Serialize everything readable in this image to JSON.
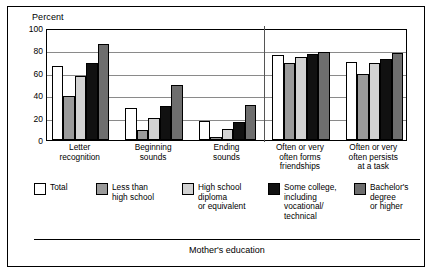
{
  "figure": {
    "y_axis_title": "Percent",
    "x_axis_title": "Mother's education"
  },
  "chart_data": {
    "type": "bar",
    "title": "",
    "subtitle": "",
    "xlabel": "Mother's education",
    "ylabel": "Percent",
    "ylim": [
      0,
      100
    ],
    "yticks": [
      0,
      20,
      40,
      60,
      80,
      100
    ],
    "ytick_labels": [
      "0",
      "20",
      "40",
      "60",
      "80",
      "100"
    ],
    "grid": true,
    "legend_position": "below-plot",
    "group_divider_after_category": 3,
    "categories": [
      "Letter\nrecognition",
      "Beginning\nsounds",
      "Ending\nsounds",
      "Often or very\noften forms\nfriendships",
      "Often or very\noften persists\nat a task"
    ],
    "series": [
      {
        "name": "Total",
        "color": "#ffffff",
        "values": [
          66,
          29,
          17,
          76,
          70
        ]
      },
      {
        "name": "Less than high school",
        "color": "#9a9a9a",
        "values": [
          39,
          9,
          3,
          69,
          59
        ]
      },
      {
        "name": "High school diploma or equivalent",
        "color": "#d2d2d2",
        "values": [
          57,
          20,
          10,
          74,
          69
        ]
      },
      {
        "name": "Some college, including vocational/technical",
        "color": "#111111",
        "values": [
          69,
          30,
          16,
          77,
          72
        ]
      },
      {
        "name": "Bachelor's degree or higher",
        "color": "#6e6e6e",
        "values": [
          86,
          49,
          31,
          79,
          78
        ]
      }
    ]
  },
  "legend": {
    "items": [
      {
        "label": "Total",
        "swatch": "sw-total"
      },
      {
        "label": "Less than\nhigh school",
        "swatch": "sw-lths"
      },
      {
        "label": "High school\ndiploma\nor equivalent",
        "swatch": "sw-hsdiploma"
      },
      {
        "label": "Some college,\nincluding\nvocational/\ntechnical",
        "swatch": "sw-somecoll"
      },
      {
        "label": "Bachelor's\ndegree\nor higher",
        "swatch": "sw-bachelors"
      }
    ]
  }
}
